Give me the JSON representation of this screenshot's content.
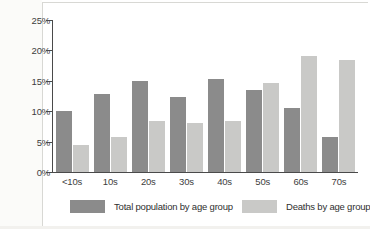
{
  "chart_data": {
    "type": "bar",
    "title": "",
    "subtitle": "",
    "xlabel": "",
    "ylabel": "",
    "categories": [
      "<10s",
      "10s",
      "20s",
      "30s",
      "40s",
      "50s",
      "60s",
      "70s"
    ],
    "series": [
      {
        "name": "Total population by age group",
        "color": "#8b8b8b",
        "values": [
          10.1,
          12.9,
          15.0,
          12.3,
          15.3,
          13.5,
          10.5,
          5.7
        ]
      },
      {
        "name": "Deaths by age group",
        "color": "#c9c9c7",
        "values": [
          4.5,
          5.7,
          8.4,
          8.1,
          8.4,
          14.6,
          19.0,
          18.4
        ]
      }
    ],
    "ylim": [
      0,
      25
    ],
    "ytick_values": [
      0,
      5,
      10,
      15,
      20,
      25
    ],
    "ytick_labels": [
      "0%",
      "5%",
      "10%",
      "15%",
      "20%",
      "25%"
    ],
    "grid": false,
    "legend_position": "bottom",
    "value_unit": "%"
  },
  "axis": {
    "y_labels": [
      "25%",
      "20%",
      "15%",
      "10%",
      "5%",
      "0%"
    ],
    "x_labels": [
      "<10s",
      "10s",
      "20s",
      "30s",
      "40s",
      "50s",
      "60s",
      "70s"
    ]
  },
  "legend": {
    "items": [
      {
        "label": "Total population by age group",
        "color": "#8b8b8b"
      },
      {
        "label": "Deaths by age group",
        "color": "#c9c9c7"
      }
    ]
  },
  "colors": {
    "series_population": "#8b8b8b",
    "series_deaths": "#c9c9c7",
    "axis": "#4a4a4a",
    "text": "#3d3d3d",
    "background": "#ffffff"
  }
}
